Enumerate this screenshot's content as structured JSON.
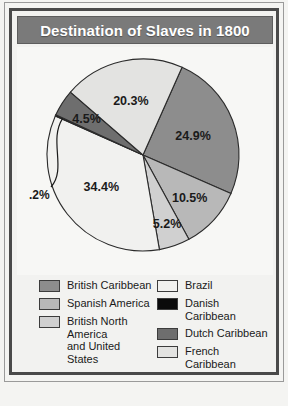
{
  "header": {
    "title": "Destination of Slaves in 1800"
  },
  "colors": {
    "title_bar": "#7a7a7a",
    "title_text": "#ffffff",
    "frame": "#4a4a4a",
    "plot_background": "#f7f7f5",
    "outline": "#2b2b2b"
  },
  "chart_data": {
    "type": "pie",
    "title": "Destination of Slaves in 1800",
    "xlabel": "",
    "ylabel": "",
    "legend_position": "bottom",
    "grid": false,
    "start_angle_deg": -66,
    "direction": "clockwise",
    "categories": [
      "British Caribbean",
      "Spanish America",
      "British North America and United States",
      "Brazil",
      "Danish Caribbean",
      "Dutch Caribbean",
      "French Caribbean"
    ],
    "values": [
      24.9,
      10.5,
      5.2,
      34.4,
      0.2,
      4.5,
      20.3
    ],
    "labels": [
      "24.9%",
      "10.5%",
      "5.2%",
      "34.4%",
      ".2%",
      "4.5%",
      "20.3%"
    ],
    "slice_colors": [
      "#8d8d8d",
      "#b8b8b8",
      "#d0d0d0",
      "#f1f1ef",
      "#0b0b0b",
      "#6e6e6e",
      "#e3e3e1"
    ],
    "callout_slices": [
      "Danish Caribbean"
    ]
  },
  "legend": {
    "left_column": [
      {
        "label": "British Caribbean",
        "color": "#8d8d8d"
      },
      {
        "label": "Spanish America",
        "color": "#b8b8b8"
      },
      {
        "label": "British North America\nand United States",
        "color": "#d0d0d0"
      }
    ],
    "right_column": [
      {
        "label": "Brazil",
        "color": "#f1f1ef"
      },
      {
        "label": "Danish Caribbean",
        "color": "#0b0b0b"
      },
      {
        "label": "Dutch Caribbean",
        "color": "#6e6e6e"
      },
      {
        "label": "French Caribbean",
        "color": "#e3e3e1"
      }
    ]
  }
}
